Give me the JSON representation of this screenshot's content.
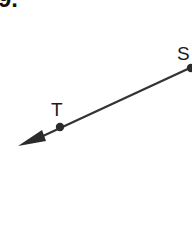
{
  "problem": {
    "number": "9."
  },
  "figure": {
    "type": "ray",
    "endpoint": "S",
    "through_point": "T",
    "points": [
      {
        "label": "S",
        "role": "endpoint"
      },
      {
        "label": "T",
        "role": "point-on-ray"
      }
    ],
    "direction": "from S through T, arrow toward lower-left",
    "colors": {
      "line": "#333333",
      "text": "#1a1a1a"
    }
  }
}
